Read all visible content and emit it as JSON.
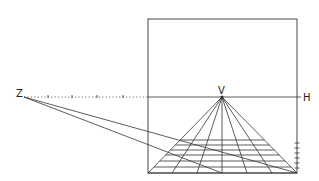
{
  "labels": {
    "z": "Z",
    "v": "V",
    "h": "H"
  },
  "colors": {
    "line": "#333333",
    "background": "#ffffff"
  },
  "geometry": {
    "frame": {
      "x1": 148,
      "y1": 19,
      "x2": 297,
      "y2": 173
    },
    "horizon_y": 97,
    "vanishing_point": {
      "x": 222,
      "y": 97
    },
    "distance_point": {
      "x": 24,
      "y": 97
    },
    "base_points_x": [
      148,
      172,
      197,
      222,
      247,
      272,
      297
    ],
    "transversal_y": [
      140,
      145,
      150,
      155,
      161,
      167,
      173
    ],
    "dotted_ticks_x": [
      48,
      72,
      97,
      123
    ],
    "right_ticks_y": [
      143,
      148,
      153,
      158,
      163,
      168
    ]
  }
}
